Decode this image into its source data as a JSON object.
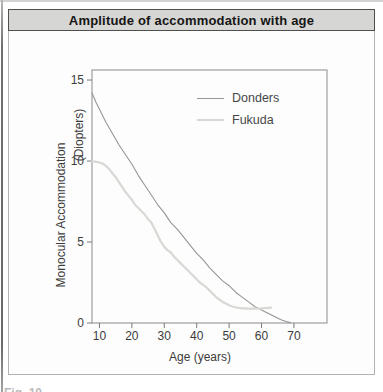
{
  "figure": {
    "title": "Amplitude of accommodation with age",
    "caption_partial": "Fig. 10"
  },
  "chart_data": {
    "type": "line",
    "title": "Amplitude of accommodation with age",
    "xlabel": "Age (years)",
    "ylabel": "Monocular Accommodation (Diopters)",
    "ylabel_line1": "Monocular Accommodation",
    "ylabel_line2": "(Diopters)",
    "xlim": [
      7.7,
      80.2
    ],
    "ylim": [
      0,
      15.62
    ],
    "x_ticks": [
      10,
      20,
      30,
      40,
      50,
      60,
      70
    ],
    "y_ticks": [
      0,
      5,
      10,
      15
    ],
    "grid": false,
    "legend_position": "upper right inside plot",
    "frame_color": "#9e9e9e",
    "tick_color": "#7a7a7a",
    "series": [
      {
        "name": "Donders",
        "color": "#969696",
        "width": 1.1,
        "x": [
          7.7,
          9,
          10,
          12,
          14,
          16,
          18,
          20,
          22,
          24,
          26,
          28,
          30,
          32,
          34,
          36,
          38,
          40,
          42,
          44,
          46,
          48,
          50,
          52,
          54,
          56,
          58,
          60,
          62,
          64,
          66,
          68,
          69
        ],
        "y": [
          14.2,
          13.6,
          13.2,
          12.4,
          11.7,
          11.0,
          10.4,
          9.8,
          9.1,
          8.5,
          7.9,
          7.3,
          6.8,
          6.2,
          5.8,
          5.3,
          4.8,
          4.3,
          3.9,
          3.4,
          3.0,
          2.6,
          2.3,
          1.9,
          1.6,
          1.3,
          1.0,
          0.8,
          0.6,
          0.4,
          0.2,
          0.07,
          0.02
        ]
      },
      {
        "name": "Fukuda",
        "color": "#d8d8d4",
        "width": 2.2,
        "x": [
          7.7,
          9,
          10,
          11,
          12,
          13,
          14,
          15,
          16,
          17,
          18,
          19,
          20,
          21,
          22,
          23,
          24,
          25,
          26,
          27,
          28,
          29,
          30,
          31,
          32,
          33,
          34,
          35,
          36,
          37,
          38,
          39,
          40,
          41,
          42,
          43,
          44,
          45,
          46,
          47,
          48,
          49,
          50,
          51,
          52,
          53,
          54,
          55,
          56,
          57,
          58,
          60,
          62,
          63
        ],
        "y": [
          10.0,
          9.95,
          9.9,
          9.85,
          9.7,
          9.5,
          9.25,
          9.0,
          8.7,
          8.4,
          8.1,
          7.85,
          7.6,
          7.3,
          7.1,
          6.9,
          6.7,
          6.4,
          6.2,
          5.8,
          5.4,
          5.0,
          4.7,
          4.5,
          4.35,
          4.1,
          3.9,
          3.7,
          3.5,
          3.3,
          3.1,
          2.9,
          2.7,
          2.5,
          2.35,
          2.2,
          2.0,
          1.8,
          1.6,
          1.45,
          1.3,
          1.2,
          1.1,
          1.02,
          0.97,
          0.93,
          0.9,
          0.9,
          0.88,
          0.88,
          0.88,
          0.9,
          0.93,
          0.95
        ]
      }
    ]
  }
}
